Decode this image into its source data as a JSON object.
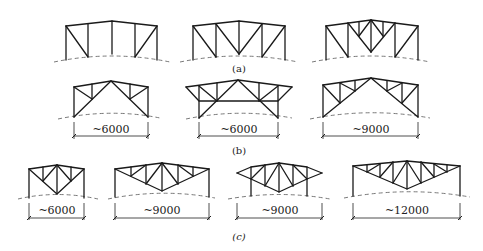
{
  "figure": {
    "rows": [
      {
        "id": "a",
        "caption": "(a)",
        "trusses": [
          {
            "id": "a1",
            "dimension": null
          },
          {
            "id": "a2",
            "dimension": null
          },
          {
            "id": "a3",
            "dimension": null
          }
        ]
      },
      {
        "id": "b",
        "caption": "(b)",
        "trusses": [
          {
            "id": "b1",
            "dimension": "~6000"
          },
          {
            "id": "b2",
            "dimension": "~6000"
          },
          {
            "id": "b3",
            "dimension": "~9000"
          }
        ]
      },
      {
        "id": "c",
        "caption": "(c)",
        "trusses": [
          {
            "id": "c1",
            "dimension": "~6000"
          },
          {
            "id": "c2",
            "dimension": "~9000"
          },
          {
            "id": "c3",
            "dimension": "~9000"
          },
          {
            "id": "c4",
            "dimension": "~12000"
          }
        ]
      }
    ],
    "colors": {
      "line": "#1a1a1a",
      "ground": "#6a6a6a",
      "background": "#ffffff"
    }
  }
}
